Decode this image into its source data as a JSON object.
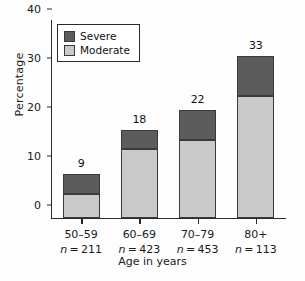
{
  "chart_data": {
    "type": "bar",
    "subtype": "stacked-bar",
    "title": "",
    "xlabel": "Age in years",
    "ylabel": "Percentage",
    "ylim": [
      0,
      40
    ],
    "yticks": [
      0,
      10,
      20,
      30,
      40
    ],
    "grid": false,
    "legend_position": "top-left",
    "categories": [
      "50–59",
      "60–69",
      "70–79",
      "80+"
    ],
    "group_sizes": [
      "n = 211",
      "n = 423",
      "n = 453",
      "n = 113"
    ],
    "group_size_values": [
      211,
      423,
      453,
      113
    ],
    "series": [
      {
        "name": "Moderate",
        "color": "#c9c9c9",
        "values": [
          5,
          14,
          16,
          25
        ]
      },
      {
        "name": "Severe",
        "color": "#5c5c5c",
        "values": [
          4,
          4,
          6,
          8
        ]
      }
    ],
    "totals": [
      9,
      18,
      22,
      33
    ],
    "total_labels": [
      "9",
      "18",
      "22",
      "33"
    ]
  },
  "legend": {
    "items": [
      {
        "label": "Severe",
        "color": "#5c5c5c"
      },
      {
        "label": "Moderate",
        "color": "#c9c9c9"
      }
    ]
  },
  "axes": {
    "y_tick_labels": [
      "0",
      "10",
      "20",
      "30",
      "40"
    ],
    "y_title": "Percentage",
    "x_title": "Age in years"
  }
}
